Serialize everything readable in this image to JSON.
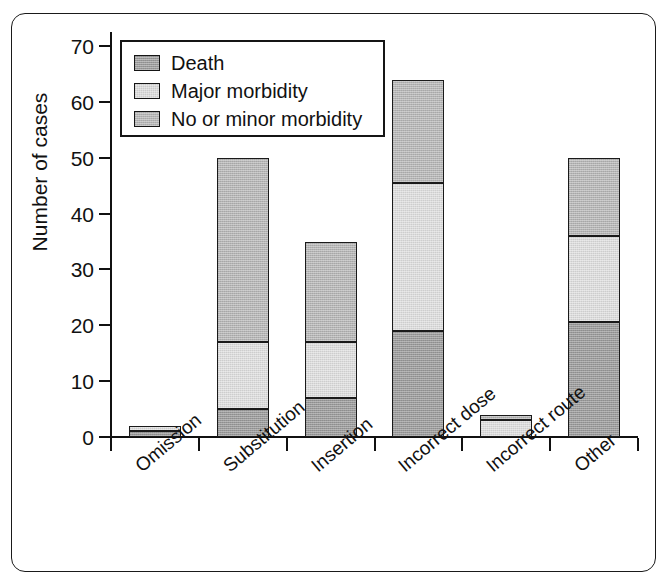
{
  "chart_data": {
    "type": "bar",
    "subtype": "stacked-vertical-bar",
    "title": "",
    "xlabel": "",
    "ylabel": "Number of cases",
    "ylim": [
      0,
      70
    ],
    "ytick_values": [
      0,
      10,
      20,
      30,
      40,
      50,
      60,
      70
    ],
    "ytick_labels": [
      "0",
      "10",
      "20",
      "30",
      "40",
      "50",
      "60",
      "70"
    ],
    "grid": false,
    "legend_position": "top-left-inside",
    "categories": [
      "Omission",
      "Substitution",
      "Insertion",
      "Incorrect dose",
      "Incorrect route",
      "Other"
    ],
    "series": [
      {
        "name": "Death",
        "color": "#9a9a9a",
        "values": [
          1,
          5,
          7,
          19,
          0,
          20.5
        ]
      },
      {
        "name": "Major morbidity",
        "color": "#dadada",
        "values": [
          1,
          12,
          10,
          26.5,
          3,
          15.5
        ]
      },
      {
        "name": "No or minor morbidity",
        "color": "#b4b4b4",
        "values": [
          0,
          33,
          18,
          18.5,
          1,
          14
        ]
      }
    ],
    "totals": [
      2,
      50,
      35,
      64,
      4,
      50
    ],
    "stack_order": [
      "Death",
      "Major morbidity",
      "No or minor morbidity"
    ]
  },
  "axes": {
    "y_title": "Number of cases"
  },
  "legend": {
    "entries": [
      {
        "label": "Death",
        "color": "#9a9a9a"
      },
      {
        "label": "Major morbidity",
        "color": "#dadada"
      },
      {
        "label": "No or minor morbidity",
        "color": "#b4b4b4"
      }
    ]
  },
  "style": {
    "axis_color": "#111111",
    "frame_color": "#1a1a1a",
    "background": "#ffffff"
  }
}
